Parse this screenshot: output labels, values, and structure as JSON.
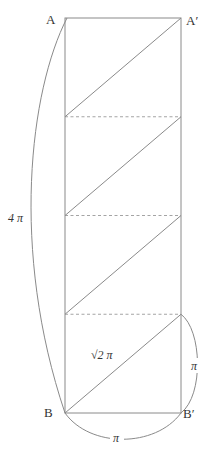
{
  "figure": {
    "type": "unrolled-cylinder-helix",
    "stroke_color": "#8a8a8a",
    "dash_color": "#9a9a9a",
    "label_color": "#333333",
    "labels": {
      "top_left": "A",
      "top_right": "A′",
      "bottom_left": "B",
      "bottom_right": "B′",
      "left_arc": "4 π",
      "diagonal": "√2 π",
      "right_arc": "π",
      "bottom_arc": "π"
    },
    "rectangle": {
      "x": 65,
      "y": 18,
      "width": 116,
      "height": 395
    },
    "segments": 4,
    "dashed_dividers_y": [
      116,
      215,
      314
    ]
  }
}
